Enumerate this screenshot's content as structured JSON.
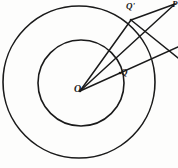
{
  "figure": {
    "background_color": "#fdfdfc",
    "stroke_color": "#1a1a1a",
    "labels": {
      "center": "O",
      "inner_point": "Q",
      "outer_point": "Q'",
      "apex_point": "P"
    }
  },
  "chart_data": {
    "type": "diagram",
    "xlabel": "",
    "ylabel": "",
    "xlim": [
      0,
      178
    ],
    "ylim": [
      0,
      168
    ],
    "grid": false,
    "legend": "none",
    "circles": [
      {
        "name": "outer-circle",
        "cx": 79,
        "cy": 82,
        "r": 76,
        "stroke": "#1a1a1a",
        "stroke_width": 1.6,
        "fill": "none"
      },
      {
        "name": "inner-circle",
        "cx": 81,
        "cy": 83,
        "r": 43,
        "stroke": "#1a1a1a",
        "stroke_width": 1.6,
        "fill": "none"
      }
    ],
    "points": [
      {
        "name": "O",
        "label": "O",
        "x": 80,
        "y": 91,
        "role": "center"
      },
      {
        "name": "Q",
        "label": "Q",
        "x": 120,
        "y": 73,
        "role": "inner-circle-point"
      },
      {
        "name": "Qp",
        "label": "Q'",
        "x": 131,
        "y": 20,
        "role": "outer-circle-point"
      },
      {
        "name": "P",
        "label": "P",
        "x": 175,
        "y": 4,
        "role": "external-apex"
      }
    ],
    "segments": [
      {
        "name": "O-to-Qprime",
        "from": "O",
        "to": "Qp",
        "x1": 80,
        "y1": 91,
        "x2": 131,
        "y2": 20
      },
      {
        "name": "O-to-P",
        "from": "O",
        "to": "P",
        "x1": 80,
        "y1": 91,
        "x2": 175,
        "y2": 4
      },
      {
        "name": "Qprime-to-P",
        "from": "Qp",
        "to": "P",
        "x1": 131,
        "y1": 20,
        "x2": 175,
        "y2": 4
      },
      {
        "name": "Qprime-to-lowerright",
        "from": "Qp",
        "to": "edge",
        "x1": 131,
        "y1": 20,
        "x2": 178,
        "y2": 58
      },
      {
        "name": "O-to-Q-extended",
        "from": "O",
        "to": "edge",
        "x1": 80,
        "y1": 91,
        "x2": 178,
        "y2": 47
      }
    ]
  }
}
